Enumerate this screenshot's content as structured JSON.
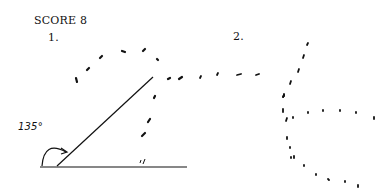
{
  "header": {
    "score_label": "SCORE 8"
  },
  "figure1": {
    "label": "1.",
    "angle_label": "135°",
    "baseline": {
      "x1": 40,
      "y1": 167,
      "x2": 187,
      "y2": 167
    },
    "ray": {
      "x1": 57,
      "y1": 166,
      "x2": 153,
      "y2": 77
    },
    "arc": "M42 166 Q44 140 66 152",
    "tick_mark": "'/",
    "dashes": [
      [
        77,
        82,
        76,
        78
      ],
      [
        87,
        70,
        89,
        68
      ],
      [
        100,
        58,
        102,
        56
      ],
      [
        122,
        51,
        125,
        52
      ],
      [
        143,
        51,
        145,
        49
      ],
      [
        157,
        59,
        158,
        60
      ],
      [
        168,
        79,
        170,
        78
      ],
      [
        179,
        79,
        182,
        77
      ],
      [
        155,
        96,
        154,
        98
      ],
      [
        150,
        119,
        148,
        122
      ],
      [
        145,
        133,
        142,
        136
      ]
    ]
  },
  "figure2": {
    "label": "2.",
    "dashes": [
      [
        201,
        76,
        200,
        78
      ],
      [
        217,
        75,
        218,
        73
      ],
      [
        237,
        75,
        241,
        74
      ],
      [
        256,
        75,
        259,
        74
      ],
      [
        308,
        43,
        307,
        45
      ],
      [
        304,
        55,
        303,
        58
      ],
      [
        299,
        69,
        298,
        72
      ],
      [
        291,
        81,
        290,
        84
      ],
      [
        284,
        95,
        283,
        97
      ],
      [
        284,
        95,
        283,
        97
      ],
      [
        284,
        94,
        284,
        96
      ],
      [
        283,
        109,
        283,
        112
      ],
      [
        287,
        118,
        286,
        121
      ],
      [
        293,
        117,
        293,
        118
      ],
      [
        308,
        112,
        308,
        113
      ],
      [
        323,
        110,
        323,
        111
      ],
      [
        340,
        110,
        340,
        111
      ],
      [
        356,
        112,
        356,
        113
      ],
      [
        374,
        117,
        374,
        119
      ],
      [
        287,
        137,
        287,
        139
      ],
      [
        290,
        147,
        290,
        148
      ],
      [
        291,
        157,
        291,
        158
      ],
      [
        294,
        156,
        294,
        158
      ],
      [
        304,
        165,
        304,
        166
      ],
      [
        316,
        174,
        316,
        175
      ],
      [
        328,
        179,
        329,
        180
      ],
      [
        345,
        181,
        345,
        182
      ],
      [
        358,
        185,
        358,
        187
      ]
    ]
  }
}
